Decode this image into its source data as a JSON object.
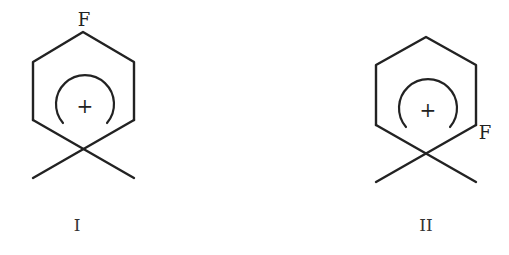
{
  "diagram": {
    "type": "chemical-structures",
    "structures": [
      {
        "id": "I",
        "label": "I",
        "substituent": "F",
        "substituent_position": "para (top vertex)",
        "charge_symbol": "+",
        "description": "Arenium (cyclohexadienyl) cation with geminal dimethyl-like crossing bonds at bottom sp3 carbon; F at top vertex"
      },
      {
        "id": "II",
        "label": "II",
        "substituent": "F",
        "substituent_position": "ortho (lower-right vertex)",
        "charge_symbol": "+",
        "description": "Arenium (cyclohexadienyl) cation with crossing bonds at bottom sp3 carbon; F at lower-right vertex"
      }
    ]
  }
}
